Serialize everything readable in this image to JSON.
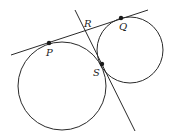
{
  "diagram": {
    "colors": {
      "stroke": "#2a2a2a",
      "point": "#1a1a1a",
      "background": "#ffffff"
    },
    "points": {
      "P": {
        "label": "P",
        "x": 49,
        "y": 43
      },
      "Q": {
        "label": "Q",
        "x": 121,
        "y": 18
      },
      "R": {
        "label": "R",
        "x": 86,
        "y": 30
      },
      "S": {
        "label": "S",
        "x": 102,
        "y": 64
      }
    },
    "circles": [
      {
        "name": "large-circle",
        "cx": 62,
        "cy": 86,
        "r": 44
      },
      {
        "name": "small-circle",
        "cx": 130,
        "cy": 50,
        "r": 33
      }
    ],
    "lines": [
      {
        "name": "tangent-line-PQ",
        "x1": 11,
        "y1": 55,
        "x2": 148,
        "y2": 10
      },
      {
        "name": "tangent-line-RS",
        "x1": 75,
        "y1": 10,
        "x2": 135,
        "y2": 131
      }
    ]
  }
}
